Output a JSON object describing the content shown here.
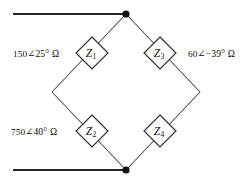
{
  "figure": {
    "type": "impedance-bridge-circuit"
  },
  "components": [
    {
      "id": "z1",
      "symbol": "Z",
      "subscript": "1",
      "value_text": "150 ∠25° Ω",
      "magnitude": "150",
      "angle": "∠25°",
      "unit": "Ω",
      "position": "upper-left"
    },
    {
      "id": "z2",
      "symbol": "Z",
      "subscript": "2",
      "value_text": "750 ∠40° Ω",
      "magnitude": "750",
      "angle": "∠40°",
      "unit": "Ω",
      "position": "lower-left"
    },
    {
      "id": "z3",
      "symbol": "Z",
      "subscript": "3",
      "value_text": "60 ∠−39° Ω",
      "magnitude": "60",
      "angle": "∠−39°",
      "unit": "Ω",
      "position": "upper-right"
    },
    {
      "id": "z4",
      "symbol": "Z",
      "subscript": "4",
      "value_text": "",
      "magnitude": "",
      "angle": "",
      "unit": "",
      "position": "lower-right"
    }
  ],
  "nodes": [
    {
      "id": "top-node",
      "label": "",
      "x": 126,
      "y": 14
    },
    {
      "id": "bottom-node",
      "label": "",
      "x": 126,
      "y": 170
    }
  ],
  "terminals": [
    {
      "id": "top-lead",
      "x1": 13,
      "y1": 14,
      "x2": 126,
      "y2": 14
    },
    {
      "id": "bottom-lead",
      "x1": 13,
      "y1": 170,
      "x2": 126,
      "y2": 170
    }
  ],
  "colors": {
    "background": "#ffffff",
    "lead": "#262626",
    "branch": "#4a4a4a",
    "node": "#141414",
    "component_stroke": "#2e2e2e",
    "text": "#0d0d0d"
  }
}
